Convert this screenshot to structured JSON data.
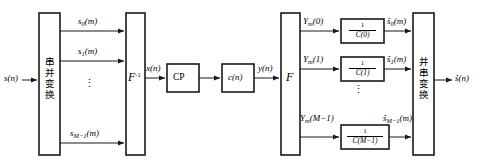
{
  "diagram": {
    "type": "block-diagram",
    "colors": {
      "stroke": "#1a1a1a",
      "fill": "#ffffff",
      "text": "#000000"
    }
  },
  "input": {
    "label": "s(n)"
  },
  "output": {
    "label": "ŝ(n)"
  },
  "blocks": {
    "serial_to_parallel": {
      "label": "串并变换",
      "meaning": "serial-to-parallel-conversion"
    },
    "idft": {
      "label": "F",
      "superscript": "-1",
      "meaning": "inverse-fourier-transform"
    },
    "cp": {
      "label": "CP",
      "meaning": "cyclic-prefix"
    },
    "channel": {
      "label": "c(n)",
      "meaning": "channel"
    },
    "dft": {
      "label": "F",
      "superscript": "",
      "meaning": "fourier-transform"
    },
    "parallel_to_serial": {
      "label": "并串变换",
      "meaning": "parallel-to-serial-conversion"
    }
  },
  "left_branches": [
    {
      "label": "s",
      "sub": "0",
      "arg": "(m)"
    },
    {
      "label": "s",
      "sub": "1",
      "arg": "(m)"
    },
    {
      "label": "s",
      "sub": "M−1",
      "arg": "(m)"
    }
  ],
  "mid_signals": {
    "x": "x(n)",
    "y": "y(n)"
  },
  "right_branches": [
    {
      "in_label": "Y",
      "in_sub": "m",
      "in_arg": "(0)",
      "eq_num": "1",
      "eq_den": "C(0)",
      "out_label": "ŝ",
      "out_sub": "0",
      "out_arg": "(m)"
    },
    {
      "in_label": "Y",
      "in_sub": "m",
      "in_arg": "(1)",
      "eq_num": "1",
      "eq_den": "C(1)",
      "out_label": "ŝ",
      "out_sub": "1",
      "out_arg": "(m)"
    },
    {
      "in_label": "Y",
      "in_sub": "m",
      "in_arg": "(M−1)",
      "eq_num": "1",
      "eq_den": "C(M−1)",
      "out_label": "ŝ",
      "out_sub": "M−1",
      "out_arg": "(m)"
    }
  ],
  "ellipsis": {
    "glyph": "⋮"
  }
}
